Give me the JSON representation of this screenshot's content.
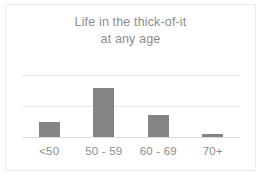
{
  "chart_data": {
    "type": "bar",
    "title": "Life in the thick-of-it at any age",
    "title_lines": [
      "Life in the thick-of-it",
      "at any age"
    ],
    "categories": [
      "<50",
      "50 - 59",
      "60 - 69",
      "70+"
    ],
    "values": [
      24,
      79,
      35,
      5
    ],
    "series": [
      {
        "name": "respondents",
        "values": [
          24,
          79,
          35,
          5
        ]
      }
    ],
    "xlabel": "",
    "ylabel": "",
    "ylim": [
      0,
      100
    ],
    "y_gridlines": [
      0,
      50,
      100
    ],
    "y_tick_labels_shown": false,
    "grid": true,
    "legend": false,
    "legend_position": "none",
    "bar_color": "#848484",
    "gridline_color": "#e8e8e8",
    "baseline_color": "#dcdcdc",
    "title_color": "#8c8c8c",
    "label_color": "#8c8c8c",
    "background_color": "#ffffff",
    "border_color": "#ebebeb"
  }
}
